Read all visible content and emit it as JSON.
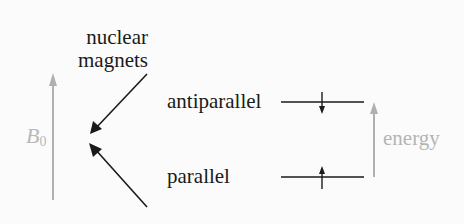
{
  "diagram": {
    "title_lines": [
      "nuclear",
      "magnets"
    ],
    "field_label": {
      "symbol": "B",
      "subscript": "0"
    },
    "states": [
      {
        "label": "antiparallel",
        "spin": "down",
        "level": "upper"
      },
      {
        "label": "parallel",
        "spin": "up",
        "level": "lower"
      }
    ],
    "energy_label": "energy",
    "colors": {
      "ink": "#1a1a1a",
      "gray": "#b0b0b0",
      "background": "#fbfbfb"
    }
  }
}
